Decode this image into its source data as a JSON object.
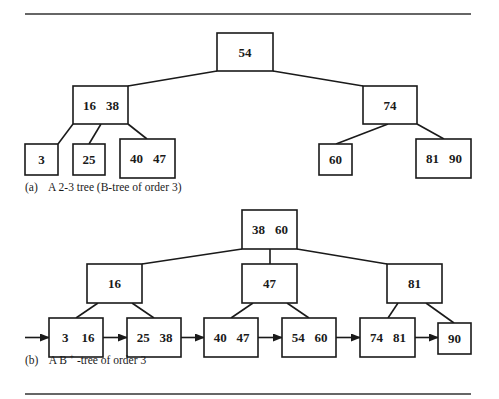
{
  "figure": {
    "tree_a": {
      "caption_label": "(a)",
      "caption_text": "A 2-3 tree (B-tree of order 3)",
      "nodes": [
        {
          "id": "a-root",
          "keys": [
            "54"
          ],
          "children": [
            "a-n1",
            "a-n2"
          ]
        },
        {
          "id": "a-n1",
          "keys": [
            "16",
            "38"
          ],
          "children": [
            "a-l1",
            "a-l2",
            "a-l3"
          ]
        },
        {
          "id": "a-n2",
          "keys": [
            "74"
          ],
          "children": [
            "a-l4",
            "a-l5"
          ]
        },
        {
          "id": "a-l1",
          "keys": [
            "3"
          ],
          "children": []
        },
        {
          "id": "a-l2",
          "keys": [
            "25"
          ],
          "children": []
        },
        {
          "id": "a-l3",
          "keys": [
            "40",
            "47"
          ],
          "children": []
        },
        {
          "id": "a-l4",
          "keys": [
            "60"
          ],
          "children": []
        },
        {
          "id": "a-l5",
          "keys": [
            "81",
            "90"
          ],
          "children": []
        }
      ]
    },
    "tree_b": {
      "caption_label": "(b)",
      "caption_prefix": "A B",
      "caption_sup": "+",
      "caption_suffix": "-tree of order 3",
      "nodes": [
        {
          "id": "b-root",
          "keys": [
            "38",
            "60"
          ],
          "children": [
            "b-n1",
            "b-n2",
            "b-n3"
          ]
        },
        {
          "id": "b-n1",
          "keys": [
            "16"
          ],
          "children": [
            "b-l1",
            "b-l2"
          ]
        },
        {
          "id": "b-n2",
          "keys": [
            "47"
          ],
          "children": [
            "b-l3",
            "b-l4"
          ]
        },
        {
          "id": "b-n3",
          "keys": [
            "81"
          ],
          "children": [
            "b-l5",
            "b-l6"
          ]
        },
        {
          "id": "b-l1",
          "keys": [
            "3",
            "16"
          ],
          "children": []
        },
        {
          "id": "b-l2",
          "keys": [
            "25",
            "38"
          ],
          "children": []
        },
        {
          "id": "b-l3",
          "keys": [
            "40",
            "47"
          ],
          "children": []
        },
        {
          "id": "b-l4",
          "keys": [
            "54",
            "60"
          ],
          "children": []
        },
        {
          "id": "b-l5",
          "keys": [
            "74",
            "81"
          ],
          "children": []
        },
        {
          "id": "b-l6",
          "keys": [
            "90"
          ],
          "children": []
        }
      ],
      "leaf_chain": [
        "b-l1",
        "b-l2",
        "b-l3",
        "b-l4",
        "b-l5",
        "b-l6"
      ]
    }
  }
}
